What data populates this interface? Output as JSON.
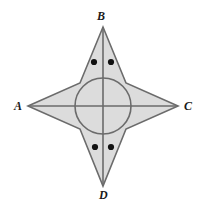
{
  "figure": {
    "canvas": {
      "width": 206,
      "height": 208,
      "background": "#ffffff"
    },
    "style": {
      "star_fill": "#dcdcdc",
      "circle_fill": "#dcdcdc",
      "stroke": "#6b6b6b",
      "stroke_width": 1.6,
      "dot_color": "#111111",
      "label_color": "#1a1a1a"
    },
    "center": {
      "x": 103,
      "y": 106
    },
    "circle": {
      "cx": 103,
      "cy": 106,
      "r": 28
    },
    "vertices": [
      {
        "name": "A",
        "label": "A",
        "x": 28,
        "y": 106,
        "label_x": 14,
        "label_y": 100
      },
      {
        "name": "B",
        "label": "B",
        "x": 103,
        "y": 27,
        "label_x": 97,
        "label_y": 10
      },
      {
        "name": "C",
        "label": "C",
        "x": 178,
        "y": 106,
        "label_x": 184,
        "label_y": 100
      },
      {
        "name": "D",
        "label": "D",
        "x": 103,
        "y": 186,
        "label_x": 99,
        "label_y": 189
      }
    ],
    "waist_points": [
      {
        "name": "upper-left",
        "x": 80,
        "y": 83
      },
      {
        "name": "upper-right",
        "x": 126,
        "y": 83
      },
      {
        "name": "lower-right",
        "x": 126,
        "y": 129
      },
      {
        "name": "lower-left",
        "x": 80,
        "y": 129
      }
    ],
    "star_path": "M 28 106 L 80 83 L 103 27 L 126 83 L 178 106 L 126 129 L 103 186 L 80 129 Z",
    "diagonals": [
      {
        "name": "diagonal-AC",
        "x1": 28,
        "y1": 106,
        "x2": 178,
        "y2": 106
      },
      {
        "name": "diagonal-BD",
        "x1": 103,
        "y1": 27,
        "x2": 103,
        "y2": 186
      }
    ],
    "angle_dots": [
      {
        "name": "dot-angle-ABD",
        "x": 94,
        "y": 62,
        "r": 3.1
      },
      {
        "name": "dot-angle-DBC",
        "x": 111,
        "y": 62,
        "r": 3.1
      },
      {
        "name": "dot-angle-BDA",
        "x": 95,
        "y": 147,
        "r": 3.1
      },
      {
        "name": "dot-angle-BDC",
        "x": 111,
        "y": 147,
        "r": 3.1
      }
    ]
  }
}
